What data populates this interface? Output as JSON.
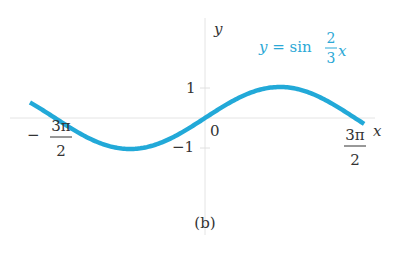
{
  "chart_data": {
    "type": "line",
    "title": "",
    "function": "y = sin(2/3 x)",
    "series": [
      {
        "name": "y = sin 2/3 x",
        "color": "#22a9d8",
        "x": [
          -5.5,
          -4.712,
          -3.534,
          -2.356,
          -1.178,
          0,
          1.178,
          2.356,
          3.534,
          4.712,
          5.0
        ],
        "y": [
          0.6,
          0.0,
          -0.71,
          -1.0,
          -0.71,
          0.0,
          0.71,
          1.0,
          0.71,
          0.0,
          -0.19
        ]
      }
    ],
    "xlabel": "x",
    "ylabel": "y",
    "xticks": [
      "-3π/2",
      "0",
      "3π/2"
    ],
    "yticks": [
      "1",
      "-1"
    ],
    "xlim": [
      -5.5,
      5.0
    ],
    "ylim": [
      -3.0,
      3.5
    ],
    "grid": false,
    "annotation": "y = sin (2/3)x",
    "caption": "(b)"
  },
  "labels": {
    "y_axis": "y",
    "x_axis": "x",
    "eq_lhs": "y = sin",
    "eq_num": "2",
    "eq_den": "3",
    "eq_var": "x",
    "tick_one": "1",
    "tick_neg_one": "−1",
    "origin": "0",
    "neg_minus": "−",
    "frac_num": "3π",
    "frac_den": "2",
    "caption": "(b)"
  }
}
